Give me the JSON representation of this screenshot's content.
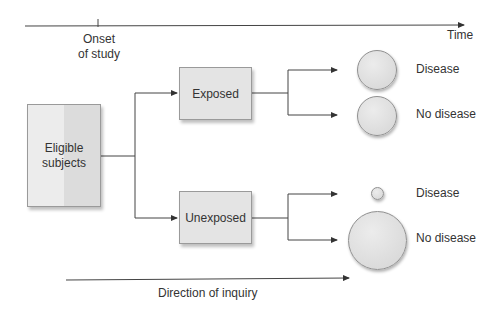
{
  "timeline": {
    "onset_label_line1": "Onset",
    "onset_label_line2": "of study",
    "time_label": "Time"
  },
  "nodes": {
    "eligible": {
      "line1": "Eligible",
      "line2": "subjects"
    },
    "exposed": "Exposed",
    "unexposed": "Unexposed"
  },
  "outcomes": {
    "exposed": [
      {
        "label": "Disease",
        "relative_size": "medium"
      },
      {
        "label": "No disease",
        "relative_size": "medium"
      }
    ],
    "unexposed": [
      {
        "label": "Disease",
        "relative_size": "small"
      },
      {
        "label": "No disease",
        "relative_size": "large"
      }
    ]
  },
  "inquiry": {
    "label": "Direction of inquiry"
  },
  "colors": {
    "line": "#333333",
    "box_fill": "#e4e4e4",
    "circle_fill": "#e0e0e0"
  }
}
